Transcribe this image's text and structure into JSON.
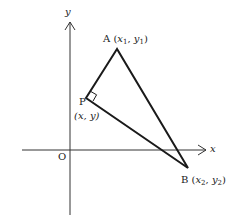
{
  "diagram": {
    "axes": {
      "x_label": "x",
      "y_label": "y",
      "origin_label": "O"
    },
    "points": {
      "A": {
        "name": "A",
        "coord_open": "(",
        "x": "x",
        "x_sub": "1",
        "sep": ", ",
        "y": "y",
        "y_sub": "1",
        "coord_close": ")"
      },
      "P": {
        "name": "P",
        "coords": "(x, y)"
      },
      "B": {
        "name": "B",
        "coord_open": "(",
        "x": "x",
        "x_sub": "2",
        "sep": ", ",
        "y": "y",
        "y_sub": "2",
        "coord_close": ")"
      }
    },
    "right_angle_at": "P",
    "colors": {
      "stroke": "#1a1a1a",
      "axis": "#333333"
    }
  }
}
